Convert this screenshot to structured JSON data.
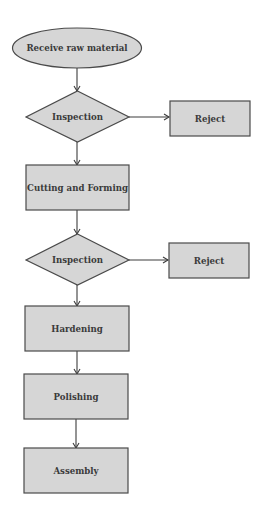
{
  "diagram": {
    "type": "flowchart",
    "colors": {
      "node_fill": "#d6d6d6",
      "node_stroke": "#4a4a4a",
      "edge": "#3c3c3c",
      "text": "#3a3a3a",
      "background": "#ffffff"
    },
    "nodes": [
      {
        "id": "start",
        "shape": "ellipse",
        "label": "Receive raw material"
      },
      {
        "id": "inspect1",
        "shape": "diamond",
        "label": "Inspection"
      },
      {
        "id": "reject1",
        "shape": "rect",
        "label": "Reject"
      },
      {
        "id": "cutting",
        "shape": "rect",
        "label": "Cutting and Forming"
      },
      {
        "id": "inspect2",
        "shape": "diamond",
        "label": "Inspection"
      },
      {
        "id": "reject2",
        "shape": "rect",
        "label": "Reject"
      },
      {
        "id": "hardening",
        "shape": "rect",
        "label": "Hardening"
      },
      {
        "id": "polishing",
        "shape": "rect",
        "label": "Polishing"
      },
      {
        "id": "assembly",
        "shape": "rect",
        "label": "Assembly"
      }
    ],
    "edges": [
      {
        "from": "start",
        "to": "inspect1"
      },
      {
        "from": "inspect1",
        "to": "reject1"
      },
      {
        "from": "inspect1",
        "to": "cutting"
      },
      {
        "from": "cutting",
        "to": "inspect2"
      },
      {
        "from": "inspect2",
        "to": "reject2"
      },
      {
        "from": "inspect2",
        "to": "hardening"
      },
      {
        "from": "hardening",
        "to": "polishing"
      },
      {
        "from": "polishing",
        "to": "assembly"
      }
    ]
  }
}
